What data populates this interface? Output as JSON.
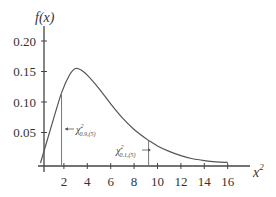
{
  "chart_data": {
    "type": "line",
    "title": "",
    "xlabel": "x²",
    "ylabel": "f(x)",
    "xlim": [
      0,
      17
    ],
    "ylim": [
      0,
      0.22
    ],
    "grid": false,
    "legend": null,
    "x_ticks": [
      "2",
      "4",
      "6",
      "8",
      "10",
      "12",
      "14",
      "16"
    ],
    "y_ticks": [
      "0.05",
      "0.10",
      "0.15",
      "0.20"
    ],
    "series": [
      {
        "name": "chi-square density, 5 df",
        "x": [
          0,
          1,
          1.8,
          2.5,
          3,
          3.5,
          4,
          5,
          6,
          7,
          8,
          9,
          9.24,
          10,
          11,
          12,
          13,
          14,
          15,
          16
        ],
        "values": [
          0,
          0.065,
          0.115,
          0.145,
          0.155,
          0.152,
          0.144,
          0.122,
          0.097,
          0.074,
          0.055,
          0.04,
          0.037,
          0.028,
          0.019,
          0.012,
          0.007,
          0.004,
          0.002,
          0.001
        ]
      }
    ],
    "annotations": [
      {
        "label": "χ²",
        "subscript": "0.9,(5)",
        "x": 1.8,
        "arrow": "left"
      },
      {
        "label": "χ²",
        "subscript": "0.1,(5)",
        "x": 9.24,
        "arrow": "right"
      }
    ]
  },
  "labels": {
    "y_axis_title": "f(x)",
    "x_axis_title_base": "x",
    "x_axis_title_sup": "2",
    "annot1_main": "χ",
    "annot1_sup": "2",
    "annot1_sub": "0.9,(5)",
    "annot2_main": "χ",
    "annot2_sup": "2",
    "annot2_sub": "0.1,(5)"
  }
}
